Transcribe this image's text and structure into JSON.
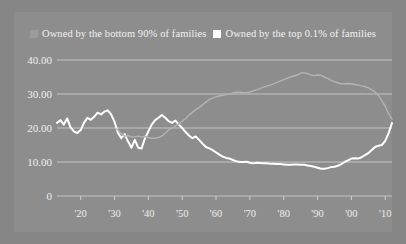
{
  "figure": {
    "background_color": "#868686",
    "panel_color": "#8d8d8d"
  },
  "legend": {
    "position": "top-center",
    "items": [
      {
        "label": "Owned by the bottom 90% of families",
        "color": "#9c9c9c",
        "marker": "square-swatch-gray"
      },
      {
        "label": "Owned by the top 0.1% of families",
        "color": "#ffffff",
        "marker": "square-swatch-white"
      }
    ]
  },
  "axes": {
    "y_ticks": [
      "0",
      "10.00",
      "20.00",
      "30.00",
      "40.00"
    ],
    "x_ticks": [
      "'20",
      "'30",
      "'40",
      "'50",
      "'60",
      "'70",
      "'80",
      "'90",
      "'00",
      "'10"
    ]
  },
  "chart_data": {
    "type": "line",
    "title": "",
    "subtitle": "",
    "xlabel": "",
    "ylabel": "",
    "xlim": [
      1913,
      2012
    ],
    "ylim": [
      0,
      40
    ],
    "grid": true,
    "legend_position": "top-center",
    "y_tick_values": [
      0,
      10,
      20,
      30,
      40
    ],
    "y_tick_labels": [
      "0",
      "10.00",
      "20.00",
      "30.00",
      "40.00"
    ],
    "x_tick_values": [
      1920,
      1930,
      1940,
      1950,
      1960,
      1970,
      1980,
      1990,
      2000,
      2010
    ],
    "x_tick_labels": [
      "'20",
      "'30",
      "'40",
      "'50",
      "'60",
      "'70",
      "'80",
      "'90",
      "'00",
      "'10"
    ],
    "series": [
      {
        "name": "Owned by the top 0.1% of families",
        "color": "#ffffff",
        "x": [
          1913,
          1914,
          1915,
          1916,
          1917,
          1918,
          1919,
          1920,
          1921,
          1922,
          1923,
          1924,
          1925,
          1926,
          1927,
          1928,
          1929,
          1930,
          1931,
          1932,
          1933,
          1934,
          1935,
          1936,
          1937,
          1938,
          1939,
          1940,
          1941,
          1942,
          1943,
          1944,
          1945,
          1946,
          1947,
          1948,
          1949,
          1950,
          1951,
          1952,
          1953,
          1954,
          1955,
          1956,
          1957,
          1958,
          1959,
          1960,
          1961,
          1962,
          1963,
          1964,
          1965,
          1966,
          1967,
          1968,
          1969,
          1970,
          1971,
          1972,
          1973,
          1974,
          1975,
          1976,
          1977,
          1978,
          1979,
          1980,
          1981,
          1982,
          1983,
          1984,
          1985,
          1986,
          1987,
          1988,
          1989,
          1990,
          1991,
          1992,
          1993,
          1994,
          1995,
          1996,
          1997,
          1998,
          1999,
          2000,
          2001,
          2002,
          2003,
          2004,
          2005,
          2006,
          2007,
          2008,
          2009,
          2010,
          2011,
          2012
        ],
        "values": [
          21.5,
          22.3,
          21.0,
          22.8,
          20.2,
          19.0,
          18.5,
          19.4,
          21.6,
          23.0,
          22.4,
          23.3,
          24.5,
          24.0,
          24.8,
          25.2,
          24.0,
          21.8,
          18.6,
          17.0,
          18.2,
          16.0,
          14.2,
          16.5,
          14.2,
          14.0,
          17.0,
          19.0,
          21.0,
          22.3,
          23.0,
          23.8,
          23.0,
          22.0,
          21.5,
          22.2,
          21.0,
          20.0,
          18.8,
          17.8,
          17.0,
          17.5,
          16.5,
          15.4,
          14.4,
          14.0,
          13.5,
          12.8,
          12.2,
          11.6,
          11.2,
          11.0,
          10.6,
          10.2,
          10.0,
          10.0,
          10.1,
          9.8,
          9.6,
          9.8,
          9.7,
          9.6,
          9.6,
          9.5,
          9.5,
          9.4,
          9.4,
          9.3,
          9.2,
          9.2,
          9.3,
          9.3,
          9.2,
          9.2,
          9.0,
          8.8,
          8.6,
          8.3,
          8.0,
          8.0,
          8.2,
          8.5,
          8.6,
          8.9,
          9.4,
          10.0,
          10.5,
          11.0,
          11.1,
          11.0,
          11.4,
          12.0,
          12.6,
          13.5,
          14.4,
          14.8,
          15.0,
          16.2,
          18.5,
          21.5
        ]
      },
      {
        "name": "Owned by the bottom 90% of families",
        "color": "#b3b3b3",
        "x": [
          1930,
          1931,
          1932,
          1933,
          1934,
          1935,
          1936,
          1937,
          1938,
          1939,
          1940,
          1941,
          1942,
          1943,
          1944,
          1945,
          1946,
          1947,
          1948,
          1949,
          1950,
          1951,
          1952,
          1953,
          1954,
          1955,
          1956,
          1957,
          1958,
          1959,
          1960,
          1961,
          1962,
          1963,
          1964,
          1965,
          1966,
          1967,
          1968,
          1969,
          1970,
          1971,
          1972,
          1973,
          1974,
          1975,
          1976,
          1977,
          1978,
          1979,
          1980,
          1981,
          1982,
          1983,
          1984,
          1985,
          1986,
          1987,
          1988,
          1989,
          1990,
          1991,
          1992,
          1993,
          1994,
          1995,
          1996,
          1997,
          1998,
          1999,
          2000,
          2001,
          2002,
          2003,
          2004,
          2005,
          2006,
          2007,
          2008,
          2009,
          2010,
          2011,
          2012
        ],
        "values": [
          20.0,
          19.4,
          18.2,
          17.6,
          17.8,
          17.4,
          17.4,
          17.6,
          17.4,
          17.5,
          17.2,
          17.0,
          17.0,
          17.2,
          17.6,
          18.5,
          19.4,
          20.0,
          20.6,
          21.2,
          22.0,
          22.8,
          23.8,
          24.6,
          25.4,
          26.0,
          26.8,
          27.6,
          28.4,
          28.8,
          29.2,
          29.4,
          29.6,
          29.8,
          30.0,
          30.3,
          30.5,
          30.5,
          30.4,
          30.4,
          30.6,
          30.9,
          31.2,
          31.6,
          32.0,
          32.3,
          32.6,
          33.0,
          33.4,
          33.8,
          34.2,
          34.6,
          35.0,
          35.3,
          35.6,
          36.1,
          36.3,
          36.0,
          35.6,
          35.4,
          35.6,
          35.5,
          35.0,
          34.6,
          34.0,
          33.6,
          33.3,
          33.0,
          33.0,
          33.1,
          33.0,
          32.8,
          32.6,
          32.4,
          32.2,
          31.8,
          31.2,
          30.6,
          29.6,
          28.0,
          26.4,
          24.2,
          22.6
        ]
      }
    ]
  }
}
